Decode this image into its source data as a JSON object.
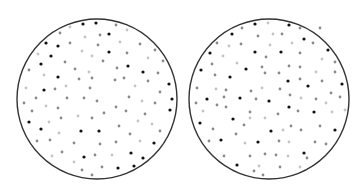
{
  "figure": {
    "colors": {
      "background": "#ffffff",
      "outline": "#333333",
      "dot_black": "#111111",
      "dot_mid": "#8a8a8a",
      "dot_light": "#c4c4c4"
    },
    "circles": [
      {
        "name": "left-circle",
        "cx": 97,
        "cy": 99,
        "r": 80,
        "dots": [
          {
            "x": 83,
            "y": 24,
            "t": "b"
          },
          {
            "x": 96,
            "y": 23,
            "t": "b"
          },
          {
            "x": 109,
            "y": 34,
            "t": "b"
          },
          {
            "x": 46,
            "y": 43,
            "t": "b"
          },
          {
            "x": 58,
            "y": 46,
            "t": "b"
          },
          {
            "x": 51,
            "y": 56,
            "t": "b"
          },
          {
            "x": 109,
            "y": 52,
            "t": "b"
          },
          {
            "x": 41,
            "y": 64,
            "t": "b"
          },
          {
            "x": 128,
            "y": 66,
            "t": "b"
          },
          {
            "x": 143,
            "y": 72,
            "t": "b"
          },
          {
            "x": 58,
            "y": 77,
            "t": "b"
          },
          {
            "x": 169,
            "y": 84,
            "t": "b"
          },
          {
            "x": 44,
            "y": 90,
            "t": "b"
          },
          {
            "x": 172,
            "y": 99,
            "t": "b"
          },
          {
            "x": 170,
            "y": 110,
            "t": "b"
          },
          {
            "x": 29,
            "y": 122,
            "t": "b"
          },
          {
            "x": 41,
            "y": 129,
            "t": "b"
          },
          {
            "x": 81,
            "y": 131,
            "t": "b"
          },
          {
            "x": 99,
            "y": 131,
            "t": "b"
          },
          {
            "x": 154,
            "y": 143,
            "t": "b"
          },
          {
            "x": 84,
            "y": 157,
            "t": "b"
          },
          {
            "x": 131,
            "y": 153,
            "t": "b"
          },
          {
            "x": 143,
            "y": 158,
            "t": "b"
          },
          {
            "x": 134,
            "y": 166,
            "t": "b"
          },
          {
            "x": 118,
            "y": 168,
            "t": "b"
          },
          {
            "x": 70,
            "y": 27,
            "t": "l"
          },
          {
            "x": 116,
            "y": 25,
            "t": "m"
          },
          {
            "x": 127,
            "y": 30,
            "t": "l"
          },
          {
            "x": 60,
            "y": 33,
            "t": "m"
          },
          {
            "x": 100,
            "y": 35,
            "t": "m"
          },
          {
            "x": 85,
            "y": 37,
            "t": "l"
          },
          {
            "x": 70,
            "y": 43,
            "t": "m"
          },
          {
            "x": 120,
            "y": 42,
            "t": "l"
          },
          {
            "x": 140,
            "y": 44,
            "t": "m"
          },
          {
            "x": 98,
            "y": 45,
            "t": "m"
          },
          {
            "x": 82,
            "y": 51,
            "t": "l"
          },
          {
            "x": 155,
            "y": 50,
            "t": "m"
          },
          {
            "x": 127,
            "y": 53,
            "t": "m"
          },
          {
            "x": 38,
            "y": 54,
            "t": "l"
          },
          {
            "x": 92,
            "y": 56,
            "t": "l"
          },
          {
            "x": 148,
            "y": 58,
            "t": "l"
          },
          {
            "x": 65,
            "y": 62,
            "t": "m"
          },
          {
            "x": 103,
            "y": 61,
            "t": "m"
          },
          {
            "x": 163,
            "y": 61,
            "t": "m"
          },
          {
            "x": 29,
            "y": 70,
            "t": "m"
          },
          {
            "x": 75,
            "y": 69,
            "t": "m"
          },
          {
            "x": 117,
            "y": 68,
            "t": "m"
          },
          {
            "x": 89,
            "y": 72,
            "t": "l"
          },
          {
            "x": 158,
            "y": 73,
            "t": "m"
          },
          {
            "x": 44,
            "y": 75,
            "t": "l"
          },
          {
            "x": 79,
            "y": 79,
            "t": "m"
          },
          {
            "x": 92,
            "y": 78,
            "t": "m"
          },
          {
            "x": 115,
            "y": 80,
            "t": "m"
          },
          {
            "x": 124,
            "y": 78,
            "t": "m"
          },
          {
            "x": 148,
            "y": 81,
            "t": "m"
          },
          {
            "x": 26,
            "y": 88,
            "t": "l"
          },
          {
            "x": 55,
            "y": 89,
            "t": "m"
          },
          {
            "x": 66,
            "y": 86,
            "t": "l"
          },
          {
            "x": 90,
            "y": 88,
            "t": "m"
          },
          {
            "x": 135,
            "y": 86,
            "t": "l"
          },
          {
            "x": 160,
            "y": 92,
            "t": "m"
          },
          {
            "x": 36,
            "y": 98,
            "t": "m"
          },
          {
            "x": 67,
            "y": 98,
            "t": "m"
          },
          {
            "x": 84,
            "y": 98,
            "t": "m"
          },
          {
            "x": 97,
            "y": 101,
            "t": "m"
          },
          {
            "x": 129,
            "y": 97,
            "t": "m"
          },
          {
            "x": 142,
            "y": 101,
            "t": "l"
          },
          {
            "x": 155,
            "y": 103,
            "t": "m"
          },
          {
            "x": 24,
            "y": 103,
            "t": "m"
          },
          {
            "x": 46,
            "y": 106,
            "t": "l"
          },
          {
            "x": 58,
            "y": 108,
            "t": "m"
          },
          {
            "x": 116,
            "y": 107,
            "t": "m"
          },
          {
            "x": 32,
            "y": 111,
            "t": "m"
          },
          {
            "x": 126,
            "y": 111,
            "t": "m"
          },
          {
            "x": 104,
            "y": 113,
            "t": "m"
          },
          {
            "x": 145,
            "y": 114,
            "t": "m"
          },
          {
            "x": 78,
            "y": 116,
            "t": "l"
          },
          {
            "x": 61,
            "y": 118,
            "t": "m"
          },
          {
            "x": 92,
            "y": 118,
            "t": "m"
          },
          {
            "x": 49,
            "y": 122,
            "t": "l"
          },
          {
            "x": 138,
            "y": 121,
            "t": "l"
          },
          {
            "x": 119,
            "y": 126,
            "t": "m"
          },
          {
            "x": 152,
            "y": 124,
            "t": "l"
          },
          {
            "x": 160,
            "y": 131,
            "t": "m"
          },
          {
            "x": 59,
            "y": 133,
            "t": "l"
          },
          {
            "x": 130,
            "y": 134,
            "t": "m"
          },
          {
            "x": 37,
            "y": 141,
            "t": "m"
          },
          {
            "x": 50,
            "y": 140,
            "t": "m"
          },
          {
            "x": 74,
            "y": 143,
            "t": "m"
          },
          {
            "x": 100,
            "y": 144,
            "t": "m"
          },
          {
            "x": 116,
            "y": 142,
            "t": "m"
          },
          {
            "x": 140,
            "y": 141,
            "t": "l"
          },
          {
            "x": 62,
            "y": 152,
            "t": "m"
          },
          {
            "x": 95,
            "y": 155,
            "t": "m"
          },
          {
            "x": 112,
            "y": 155,
            "t": "l"
          },
          {
            "x": 52,
            "y": 156,
            "t": "l"
          },
          {
            "x": 74,
            "y": 162,
            "t": "l"
          },
          {
            "x": 102,
            "y": 167,
            "t": "m"
          },
          {
            "x": 82,
            "y": 170,
            "t": "m"
          },
          {
            "x": 92,
            "y": 175,
            "t": "m"
          }
        ]
      },
      {
        "name": "right-circle",
        "cx": 269,
        "cy": 99,
        "r": 80,
        "dots": [
          {
            "x": 255,
            "y": 24,
            "t": "b"
          },
          {
            "x": 289,
            "y": 25,
            "t": "b"
          },
          {
            "x": 232,
            "y": 34,
            "t": "b"
          },
          {
            "x": 304,
            "y": 39,
            "t": "b"
          },
          {
            "x": 210,
            "y": 53,
            "t": "b"
          },
          {
            "x": 255,
            "y": 52,
            "t": "b"
          },
          {
            "x": 281,
            "y": 52,
            "t": "b"
          },
          {
            "x": 328,
            "y": 50,
            "t": "b"
          },
          {
            "x": 201,
            "y": 70,
            "t": "b"
          },
          {
            "x": 246,
            "y": 69,
            "t": "b"
          },
          {
            "x": 230,
            "y": 77,
            "t": "b"
          },
          {
            "x": 288,
            "y": 81,
            "t": "b"
          },
          {
            "x": 308,
            "y": 86,
            "t": "b"
          },
          {
            "x": 342,
            "y": 84,
            "t": "b"
          },
          {
            "x": 207,
            "y": 99,
            "t": "b"
          },
          {
            "x": 240,
            "y": 98,
            "t": "b"
          },
          {
            "x": 269,
            "y": 101,
            "t": "b"
          },
          {
            "x": 289,
            "y": 107,
            "t": "b"
          },
          {
            "x": 314,
            "y": 112,
            "t": "b"
          },
          {
            "x": 233,
            "y": 119,
            "t": "b"
          },
          {
            "x": 200,
            "y": 123,
            "t": "b"
          },
          {
            "x": 271,
            "y": 131,
            "t": "b"
          },
          {
            "x": 335,
            "y": 130,
            "t": "b"
          },
          {
            "x": 221,
            "y": 140,
            "t": "b"
          },
          {
            "x": 258,
            "y": 142,
            "t": "b"
          },
          {
            "x": 304,
            "y": 153,
            "t": "b"
          },
          {
            "x": 237,
            "y": 165,
            "t": "b"
          },
          {
            "x": 242,
            "y": 28,
            "t": "m"
          },
          {
            "x": 268,
            "y": 23,
            "t": "l"
          },
          {
            "x": 300,
            "y": 28,
            "t": "m"
          },
          {
            "x": 320,
            "y": 28,
            "t": "m"
          },
          {
            "x": 258,
            "y": 36,
            "t": "m"
          },
          {
            "x": 273,
            "y": 34,
            "t": "l"
          },
          {
            "x": 282,
            "y": 34,
            "t": "m"
          },
          {
            "x": 217,
            "y": 43,
            "t": "m"
          },
          {
            "x": 241,
            "y": 44,
            "t": "m"
          },
          {
            "x": 229,
            "y": 46,
            "t": "l"
          },
          {
            "x": 270,
            "y": 45,
            "t": "l"
          },
          {
            "x": 292,
            "y": 43,
            "t": "l"
          },
          {
            "x": 313,
            "y": 43,
            "t": "m"
          },
          {
            "x": 223,
            "y": 56,
            "t": "l"
          },
          {
            "x": 266,
            "y": 57,
            "t": "m"
          },
          {
            "x": 300,
            "y": 53,
            "t": "m"
          },
          {
            "x": 322,
            "y": 59,
            "t": "l"
          },
          {
            "x": 335,
            "y": 62,
            "t": "m"
          },
          {
            "x": 212,
            "y": 64,
            "t": "m"
          },
          {
            "x": 237,
            "y": 63,
            "t": "l"
          },
          {
            "x": 262,
            "y": 67,
            "t": "m"
          },
          {
            "x": 289,
            "y": 66,
            "t": "m"
          },
          {
            "x": 300,
            "y": 67,
            "t": "m"
          },
          {
            "x": 335,
            "y": 72,
            "t": "m"
          },
          {
            "x": 215,
            "y": 75,
            "t": "m"
          },
          {
            "x": 265,
            "y": 73,
            "t": "m"
          },
          {
            "x": 279,
            "y": 73,
            "t": "m"
          },
          {
            "x": 300,
            "y": 79,
            "t": "m"
          },
          {
            "x": 316,
            "y": 72,
            "t": "l"
          },
          {
            "x": 322,
            "y": 81,
            "t": "m"
          },
          {
            "x": 197,
            "y": 88,
            "t": "m"
          },
          {
            "x": 216,
            "y": 89,
            "t": "l"
          },
          {
            "x": 226,
            "y": 90,
            "t": "m"
          },
          {
            "x": 251,
            "y": 91,
            "t": "m"
          },
          {
            "x": 262,
            "y": 88,
            "t": "l"
          },
          {
            "x": 280,
            "y": 89,
            "t": "m"
          },
          {
            "x": 331,
            "y": 93,
            "t": "m"
          },
          {
            "x": 340,
            "y": 97,
            "t": "m"
          },
          {
            "x": 224,
            "y": 97,
            "t": "m"
          },
          {
            "x": 256,
            "y": 99,
            "t": "m"
          },
          {
            "x": 290,
            "y": 95,
            "t": "m"
          },
          {
            "x": 301,
            "y": 98,
            "t": "l"
          },
          {
            "x": 316,
            "y": 99,
            "t": "m"
          },
          {
            "x": 196,
            "y": 103,
            "t": "m"
          },
          {
            "x": 217,
            "y": 105,
            "t": "m"
          },
          {
            "x": 226,
            "y": 107,
            "t": "m"
          },
          {
            "x": 326,
            "y": 103,
            "t": "l"
          },
          {
            "x": 203,
            "y": 111,
            "t": "l"
          },
          {
            "x": 250,
            "y": 112,
            "t": "m"
          },
          {
            "x": 278,
            "y": 114,
            "t": "m"
          },
          {
            "x": 298,
            "y": 111,
            "t": "m"
          },
          {
            "x": 332,
            "y": 112,
            "t": "l"
          },
          {
            "x": 345,
            "y": 110,
            "t": "l"
          },
          {
            "x": 250,
            "y": 118,
            "t": "l"
          },
          {
            "x": 265,
            "y": 118,
            "t": "l"
          },
          {
            "x": 213,
            "y": 129,
            "t": "m"
          },
          {
            "x": 244,
            "y": 125,
            "t": "m"
          },
          {
            "x": 291,
            "y": 126,
            "t": "m"
          },
          {
            "x": 320,
            "y": 126,
            "t": "m"
          },
          {
            "x": 283,
            "y": 130,
            "t": "l"
          },
          {
            "x": 236,
            "y": 134,
            "t": "m"
          },
          {
            "x": 301,
            "y": 130,
            "t": "m"
          },
          {
            "x": 209,
            "y": 141,
            "t": "m"
          },
          {
            "x": 245,
            "y": 143,
            "t": "l"
          },
          {
            "x": 279,
            "y": 141,
            "t": "m"
          },
          {
            "x": 289,
            "y": 142,
            "t": "l"
          },
          {
            "x": 315,
            "y": 142,
            "t": "m"
          },
          {
            "x": 326,
            "y": 144,
            "t": "m"
          },
          {
            "x": 224,
            "y": 156,
            "t": "m"
          },
          {
            "x": 250,
            "y": 156,
            "t": "m"
          },
          {
            "x": 265,
            "y": 154,
            "t": "m"
          },
          {
            "x": 276,
            "y": 155,
            "t": "m"
          },
          {
            "x": 288,
            "y": 156,
            "t": "l"
          },
          {
            "x": 307,
            "y": 158,
            "t": "m"
          },
          {
            "x": 259,
            "y": 166,
            "t": "l"
          },
          {
            "x": 280,
            "y": 167,
            "t": "m"
          },
          {
            "x": 300,
            "y": 167,
            "t": "l"
          },
          {
            "x": 254,
            "y": 171,
            "t": "m"
          },
          {
            "x": 263,
            "y": 175,
            "t": "m"
          }
        ]
      }
    ]
  }
}
